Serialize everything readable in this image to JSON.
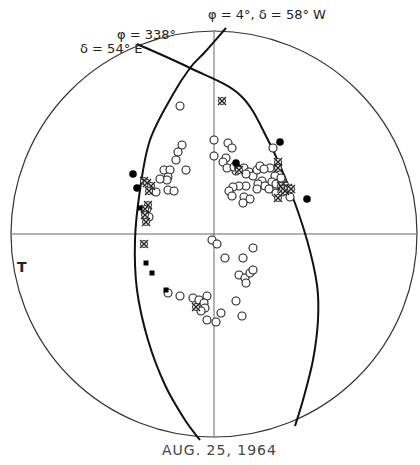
{
  "chart_data": {
    "type": "scatter",
    "title": "AUG. 25, 1964",
    "projection": "stereographic net (equal-angle) with great-circle arcs",
    "net": {
      "center": [
        214,
        234
      ],
      "radius": 203
    },
    "axes": {
      "horizontal_line": true,
      "vertical_line": true
    },
    "great_circles": [
      {
        "name": "plane-1",
        "label": "φ = 4°,  δ = 58° W",
        "points": [
          [
            226,
            28
          ],
          [
            205,
            52
          ],
          [
            190,
            68
          ],
          [
            172,
            96
          ],
          [
            150,
            140
          ],
          [
            140,
            190
          ],
          [
            135,
            240
          ],
          [
            137,
            290
          ],
          [
            148,
            340
          ],
          [
            165,
            385
          ],
          [
            185,
            420
          ],
          [
            200,
            440
          ]
        ]
      },
      {
        "name": "plane-2",
        "label_phi": "φ = 338°",
        "label_delta": "δ = 54° E",
        "points": [
          [
            137,
            44
          ],
          [
            190,
            68
          ],
          [
            240,
            95
          ],
          [
            268,
            140
          ],
          [
            290,
            190
          ],
          [
            307,
            240
          ],
          [
            317,
            285
          ],
          [
            318,
            320
          ],
          [
            313,
            360
          ],
          [
            303,
            400
          ],
          [
            295,
            426
          ]
        ]
      }
    ],
    "side_label": "T",
    "legend": [
      {
        "symbol": "open-circle",
        "meaning": "open circle"
      },
      {
        "symbol": "filled-circle",
        "meaning": "filled circle"
      },
      {
        "symbol": "crossed-circle",
        "meaning": "crossed circle"
      },
      {
        "symbol": "filled-square",
        "meaning": "filled square"
      }
    ],
    "series": [
      {
        "name": "open-circles",
        "symbol": "open-circle",
        "points": [
          [
            180,
            106
          ],
          [
            182,
            145
          ],
          [
            178,
            152
          ],
          [
            176,
            160
          ],
          [
            164,
            170
          ],
          [
            170,
            170
          ],
          [
            168,
            177
          ],
          [
            167,
            180
          ],
          [
            186,
            170
          ],
          [
            160,
            179
          ],
          [
            168,
            190
          ],
          [
            174,
            191
          ],
          [
            147,
            209
          ],
          [
            214,
            140
          ],
          [
            214,
            156
          ],
          [
            228,
            143
          ],
          [
            232,
            148
          ],
          [
            226,
            158
          ],
          [
            223,
            162
          ],
          [
            227,
            168
          ],
          [
            236,
            171
          ],
          [
            244,
            168
          ],
          [
            249,
            172
          ],
          [
            253,
            176
          ],
          [
            257,
            170
          ],
          [
            260,
            166
          ],
          [
            270,
            168
          ],
          [
            275,
            176
          ],
          [
            272,
            182
          ],
          [
            276,
            184
          ],
          [
            282,
            180
          ],
          [
            285,
            186
          ],
          [
            287,
            191
          ],
          [
            290,
            197
          ],
          [
            276,
            193
          ],
          [
            262,
            181
          ],
          [
            258,
            184
          ],
          [
            246,
            186
          ],
          [
            239,
            186
          ],
          [
            233,
            187
          ],
          [
            229,
            191
          ],
          [
            232,
            196
          ],
          [
            244,
            197
          ],
          [
            250,
            199
          ],
          [
            243,
            203
          ],
          [
            257,
            189
          ],
          [
            265,
            186
          ],
          [
            273,
            148
          ],
          [
            264,
            169
          ],
          [
            281,
            178
          ],
          [
            269,
            189
          ],
          [
            282,
            192
          ],
          [
            234,
            167
          ],
          [
            246,
            174
          ],
          [
            156,
            192
          ],
          [
            149,
            217
          ],
          [
            212,
            240
          ],
          [
            217,
            244
          ],
          [
            225,
            258
          ],
          [
            243,
            258
          ],
          [
            253,
            248
          ],
          [
            239,
            275
          ],
          [
            245,
            278
          ],
          [
            250,
            273
          ],
          [
            253,
            270
          ],
          [
            246,
            283
          ],
          [
            236,
            301
          ],
          [
            242,
            316
          ],
          [
            168,
            293
          ],
          [
            180,
            296
          ],
          [
            193,
            298
          ],
          [
            207,
            296
          ],
          [
            199,
            300
          ],
          [
            204,
            303
          ],
          [
            205,
            308
          ],
          [
            207,
            320
          ],
          [
            216,
            322
          ],
          [
            221,
            313
          ],
          [
            201,
            311
          ]
        ]
      },
      {
        "name": "filled-circles",
        "symbol": "filled-circle",
        "points": [
          [
            133,
            174
          ],
          [
            137,
            188
          ],
          [
            280,
            142
          ],
          [
            307,
            199
          ],
          [
            236,
            163
          ],
          [
            238,
            168
          ]
        ]
      },
      {
        "name": "crossed-circles",
        "symbol": "crossed-circle",
        "points": [
          [
            222,
            101
          ],
          [
            144,
            181
          ],
          [
            147,
            183
          ],
          [
            151,
            186
          ],
          [
            149,
            191
          ],
          [
            278,
            162
          ],
          [
            278,
            168
          ],
          [
            281,
            186
          ],
          [
            283,
            189
          ],
          [
            285,
            191
          ],
          [
            288,
            188
          ],
          [
            291,
            189
          ],
          [
            278,
            198
          ],
          [
            148,
            205
          ],
          [
            145,
            209
          ],
          [
            145,
            215
          ],
          [
            146,
            222
          ],
          [
            144,
            244
          ],
          [
            196,
            307
          ],
          [
            239,
            170
          ]
        ]
      },
      {
        "name": "filled-squares",
        "symbol": "filled-square",
        "points": [
          [
            146,
            263
          ],
          [
            152,
            273
          ],
          [
            166,
            290
          ],
          [
            140,
            208
          ]
        ]
      }
    ]
  },
  "labels": {
    "phi_4": "φ = 4°,  δ = 58° W",
    "phi_338": "φ = 338°",
    "delta_54": "δ = 54° E",
    "side_T": "T",
    "date": "AUG.  25,  1964"
  },
  "colors": {
    "stroke": "#1a1a1a",
    "grid": "#555555",
    "background": "#ffffff"
  }
}
